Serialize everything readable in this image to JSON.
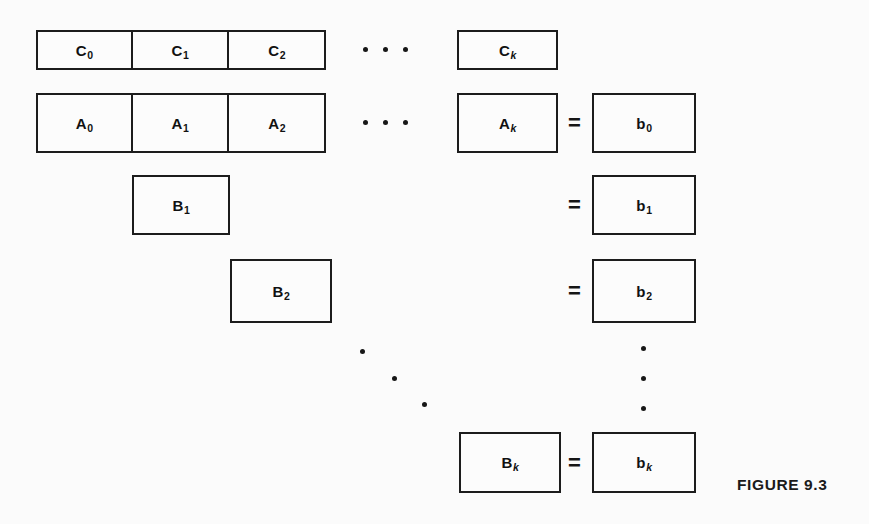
{
  "figure": {
    "label": "FIGURE 9.3",
    "background_color": "#fbfbfb",
    "line_color": "#1c1c1c",
    "text_color": "#111111"
  },
  "equals_sign": "=",
  "rows": {
    "c_row": {
      "name": "C row",
      "cells": [
        {
          "base": "C",
          "sub": "0",
          "sub_italic": false
        },
        {
          "base": "C",
          "sub": "1",
          "sub_italic": false
        },
        {
          "base": "C",
          "sub": "2",
          "sub_italic": false
        }
      ],
      "ellipsis": "· · ·",
      "tail": {
        "base": "C",
        "sub": "k",
        "sub_italic": true
      }
    },
    "a_row": {
      "name": "A row",
      "cells": [
        {
          "base": "A",
          "sub": "0",
          "sub_italic": false
        },
        {
          "base": "A",
          "sub": "1",
          "sub_italic": false
        },
        {
          "base": "A",
          "sub": "2",
          "sub_italic": false
        }
      ],
      "ellipsis": "· · ·",
      "tail": {
        "base": "A",
        "sub": "k",
        "sub_italic": true
      },
      "rhs": {
        "base": "b",
        "sub": "0",
        "sub_italic": false
      }
    },
    "b_rows": [
      {
        "name": "B1 row",
        "lhs": {
          "base": "B",
          "sub": "1",
          "sub_italic": false
        },
        "rhs": {
          "base": "b",
          "sub": "1",
          "sub_italic": false
        }
      },
      {
        "name": "B2 row",
        "lhs": {
          "base": "B",
          "sub": "2",
          "sub_italic": false
        },
        "rhs": {
          "base": "b",
          "sub": "2",
          "sub_italic": false
        }
      },
      {
        "name": "Bk row",
        "lhs": {
          "base": "B",
          "sub": "k",
          "sub_italic": true
        },
        "rhs": {
          "base": "b",
          "sub": "k",
          "sub_italic": true
        }
      }
    ]
  }
}
